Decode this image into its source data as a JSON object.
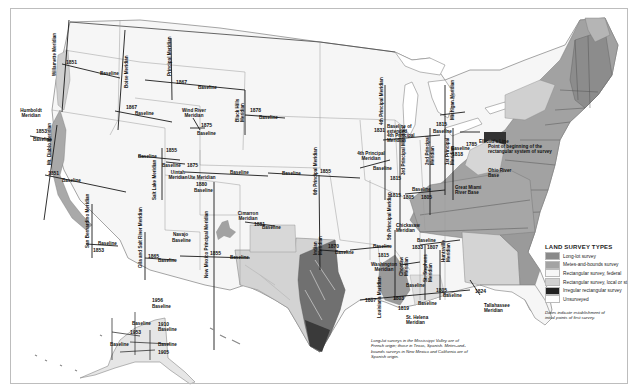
{
  "legend": {
    "title": "LAND SURVEY TYPES",
    "items": [
      {
        "label": "Long-lot survey",
        "color": "#8a8a8a"
      },
      {
        "label": "Metes-and-bounds survey",
        "color": "#a3a3a3"
      },
      {
        "label": "Rectangular survey, federal",
        "color": "#f7f7f7"
      },
      {
        "label": "Rectangular survey, local or st",
        "color": "#d2d2d2"
      },
      {
        "label": "Irregular rectangular survey",
        "color": "#222222"
      },
      {
        "label": "Unsurveyed",
        "color": "#ffffff"
      }
    ],
    "note": "Dates indicate establishment of initial points of first survey."
  },
  "caption": "Long-lot surveys in the Mississippi Valley are of French origin; those in Texas, Spanish. Metes-and-bounds surveys in New Mexico and California are of Spanish origin.",
  "colors": {
    "federal": "#f5f5f5",
    "metes": "#a0a0a0",
    "longlot": "#7c7c7c",
    "local": "#d0d0d0",
    "dark": "#4a4a4a",
    "line": "#222222",
    "border": "#9a9a9a"
  },
  "meridians": [
    {
      "id": "willamette",
      "label": "Willamette Meridian"
    },
    {
      "id": "humboldt",
      "label": "Humboldt Meridian"
    },
    {
      "id": "mt-diablo",
      "label": "Mt. Diablo Meridian"
    },
    {
      "id": "san-bernardino",
      "label": "San Bernardino Meridian"
    },
    {
      "id": "boise",
      "label": "Boise Meridian"
    },
    {
      "id": "principal",
      "label": "Principal Meridian"
    },
    {
      "id": "wind-river",
      "label": "Wind River Meridian"
    },
    {
      "id": "black-hills",
      "label": "Black Hills Meridian"
    },
    {
      "id": "salt-lake",
      "label": "Salt Lake Meridian"
    },
    {
      "id": "uintah",
      "label": "Uintah Meridian"
    },
    {
      "id": "ute",
      "label": "Ute Meridian"
    },
    {
      "id": "gila-salt",
      "label": "Gila and Salt River Meridian"
    },
    {
      "id": "navajo",
      "label": "Navajo"
    },
    {
      "id": "new-mexico",
      "label": "New Mexico Principal Meridian"
    },
    {
      "id": "cimarron",
      "label": "Cimarron Meridian"
    },
    {
      "id": "sixth",
      "label": "6th Principal Meridian"
    },
    {
      "id": "indian",
      "label": "Indian Meridian"
    },
    {
      "id": "fourth",
      "label": "4th Principal Meridian"
    },
    {
      "id": "fourth-ext",
      "label": "Baseline of extended 4th Principal Meridian"
    },
    {
      "id": "third",
      "label": "3rd Principal Meridian"
    },
    {
      "id": "second",
      "label": "2nd Principal Meridian"
    },
    {
      "id": "first",
      "label": "1st Principal Meridian"
    },
    {
      "id": "michigan",
      "label": "Michigan Meridian"
    },
    {
      "id": "fifth",
      "label": "5th Principal Meridian"
    },
    {
      "id": "chickasaw",
      "label": "Chickasaw Meridian"
    },
    {
      "id": "huntsville",
      "label": "Huntsville Meridian"
    },
    {
      "id": "choctaw",
      "label": "Choctaw Meridian"
    },
    {
      "id": "washington",
      "label": "Washington Meridian"
    },
    {
      "id": "st-stephens",
      "label": "St. Stephens Meridian"
    },
    {
      "id": "louisiana",
      "label": "Louisiana Meridian"
    },
    {
      "id": "st-helena",
      "label": "St. Helena Meridian"
    },
    {
      "id": "tallahassee",
      "label": "Tallahassee Meridian"
    },
    {
      "id": "ellicott",
      "label": "Ellicott's Line"
    },
    {
      "id": "point-beginning",
      "label": "Point of beginning of the rectangular system of survey"
    },
    {
      "id": "ohio-river",
      "label": "Ohio River Base"
    },
    {
      "id": "great-miami",
      "label": "Great Miami River Base"
    },
    {
      "id": "baseline",
      "label": "Baseline"
    }
  ],
  "labels": {
    "baseline": "Baseline",
    "willamette": "Willamette Meridian",
    "humboldt": "Humboldt\nMeridian",
    "mt_diablo": "Mt. Diablo Meridian",
    "san_bernardino": "San Bernardino Meridian",
    "boise": "Boise Meridian",
    "principal": "Principal Meridian",
    "wind_river": "Wind River\nMeridian",
    "black_hills": "Black Hills\nMeridian",
    "salt_lake": "Salt Lake Meridian",
    "uintah": "Uintah\nMeridian",
    "ute": "Ute Meridian",
    "gila": "Gila and Salt River Meridian",
    "navajo": "Navajo",
    "nm_principal": "New Mexico Principal Meridian",
    "cimarron": "Cimarron\nMeridian",
    "sixth": "6th Principal Meridian",
    "indian": "Indian\nMeridian",
    "fourth": "4th Principal\nMeridian",
    "fourth_ext": "Baseline of extended\n4th Principal Meridian",
    "third": "3rd Principal Meridian",
    "second": "2nd Principal\nMeridian",
    "first": "1st Principal\nMeridian",
    "michigan": "Michigan Meridian",
    "fifth": "5th Principal Meridian",
    "chickasaw": "Chickasaw\nMeridian",
    "huntsville": "Huntsville\nMeridian",
    "choctaw": "Choctaw\nMeridian",
    "washington": "Washington\nMeridian",
    "st_stephens": "St. Stephens\nMeridian",
    "louisiana": "Louisiana Meridian",
    "st_helena": "St. Helena\nMeridian",
    "tallahassee": "Tallahassee\nMeridian",
    "ellicott": "Ellicott's Line",
    "point_beginning": "Point of beginning of the\nrectangular system of survey",
    "ohio_river": "Ohio River\nBase",
    "great_miami": "Great Miami\nRiver Base",
    "copper_river": "Copper River",
    "fairbanks": "Fairbanks",
    "kateel": "Kateel River",
    "seward": "Seward",
    "umiat": "Umiat"
  },
  "years": {
    "y1851a": "1851",
    "y1851b": "1851",
    "y1853": "1853",
    "y1853b": "1853",
    "y1867a": "1867",
    "y1867b": "1867",
    "y1875a": "1875",
    "y1875b": "1875",
    "y1878": "1878",
    "y1855a": "1855",
    "y1855b": "1855",
    "y1855c": "1855",
    "y1880": "1880",
    "y1881": "1881",
    "y1865": "1865",
    "y1870": "1870",
    "y1831": "1831",
    "y1815a": "1815",
    "y1815b": "1815",
    "y1815c": "1815",
    "y1815d": "1815",
    "y1785": "1785",
    "y1818": "1818",
    "y1805a": "1805",
    "y1805b": "1805",
    "y1805c": "1805",
    "y1833": "1833",
    "y1807a": "1807",
    "y1807b": "1807",
    "y1803": "1803",
    "y1819": "1819",
    "y1819b": "1819",
    "y1824": "1824",
    "y1956": "1956",
    "y1910": "1910",
    "y1953": "1953",
    "y1905": "1905"
  }
}
